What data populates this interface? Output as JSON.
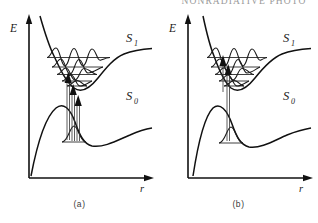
{
  "header": {
    "running_head": "NONRADIATIVE PHOTO"
  },
  "figure": {
    "panels": [
      {
        "id": "a",
        "caption": "(a)",
        "axes": {
          "y_label": "E",
          "x_label": "r"
        },
        "state_labels": [
          {
            "name": "S1",
            "text": "S",
            "sub": "1"
          },
          {
            "name": "S0",
            "text": "S",
            "sub": "0"
          }
        ],
        "description": "Excited state S1 well displaced to larger r; vertical absorption arrows reach high vibrational levels",
        "vibrational_levels_upper": 5,
        "vibrational_levels_lower": 1,
        "transition_arrows": 3
      },
      {
        "id": "b",
        "caption": "(b)",
        "axes": {
          "y_label": "E",
          "x_label": "r"
        },
        "state_labels": [
          {
            "name": "S1",
            "text": "S",
            "sub": "1"
          },
          {
            "name": "S0",
            "text": "S",
            "sub": "0"
          }
        ],
        "description": "Excited state S1 well nearly vertical above ground well; vertical absorption arrow reaches low vibrational levels",
        "vibrational_levels_upper": 5,
        "vibrational_levels_lower": 1,
        "transition_arrows": 2
      }
    ],
    "colors": {
      "curve": "#111111",
      "axis": "#111111",
      "level": "#2a2a2a",
      "wavefunction": "#1a1a1a",
      "label": "#1a1a1a"
    }
  }
}
